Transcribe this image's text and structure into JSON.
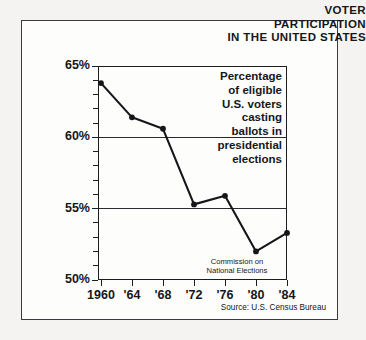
{
  "title": {
    "line1": "VOTER",
    "line2": "PARTICIPATION",
    "line3": "IN THE UNITED STATES"
  },
  "caption": {
    "l1": "Percentage",
    "l2": "of eligible",
    "l3": "U.S. voters",
    "l4": "casting",
    "l5": "ballots in",
    "l6": "presidential",
    "l7": "elections"
  },
  "credit": {
    "l1": "Commission on",
    "l2": "National Elections"
  },
  "source": "Source: U.S. Census Bureau",
  "chart_data": {
    "type": "line",
    "title": "VOTER PARTICIPATION IN THE UNITED STATES",
    "xlabel": "",
    "ylabel": "",
    "ylim": [
      50,
      65
    ],
    "yticks": [
      50,
      55,
      60,
      65
    ],
    "ytick_labels": [
      "50%",
      "55%",
      "60%",
      "65%"
    ],
    "y_minor_ticks": [
      51,
      52,
      53,
      54,
      56,
      57,
      58,
      59,
      61,
      62,
      63,
      64
    ],
    "gridlines": [
      55,
      60
    ],
    "grid": "horizontal-major-only",
    "legend": "none",
    "x": [
      1960,
      1964,
      1968,
      1972,
      1976,
      1980,
      1984
    ],
    "xtick_labels": [
      "1960",
      "'64",
      "'68",
      "'72",
      "'76",
      "'80",
      "'84"
    ],
    "categories": [
      "1960",
      "'64",
      "'68",
      "'72",
      "'76",
      "'80",
      "'84"
    ],
    "values": [
      63.8,
      61.4,
      60.6,
      55.3,
      55.9,
      52.0,
      53.3
    ],
    "series": [
      {
        "name": "Percentage of eligible U.S. voters casting ballots in presidential elections",
        "values": [
          63.8,
          61.4,
          60.6,
          55.3,
          55.9,
          52.0,
          53.3
        ]
      }
    ],
    "marker": "filled-circle",
    "line_color": "#16161a",
    "annotations": [
      "Percentage of eligible U.S. voters casting ballots in presidential elections",
      "Commission on National Elections"
    ]
  },
  "colors": {
    "ink": "#16161a",
    "frame": "#3b3b3f",
    "paper": "#fdfdfc",
    "page": "#f4f3f1"
  }
}
